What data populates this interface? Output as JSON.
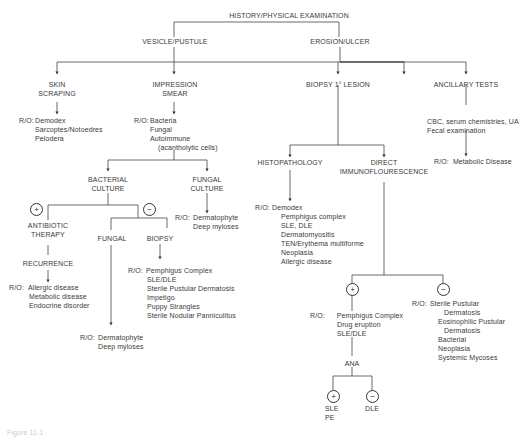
{
  "title": "HISTORY/PHYSICAL EXAMINATION",
  "branches": {
    "vesicle": "VESICLE/PUSTULE",
    "erosion": "EROSION/ULCER"
  },
  "nodes": {
    "skin_scraping": [
      "SKIN",
      "SCRAPING"
    ],
    "impression_smear": [
      "IMPRESSION",
      "SMEAR"
    ],
    "biopsy_lesion": "BIOPSY 1° LESION",
    "ancillary_tests": "ANCILLARY TESTS",
    "bacterial_culture": [
      "BACTERIAL",
      "CULTURE"
    ],
    "fungal_culture": [
      "FUNGAL",
      "CULTURE"
    ],
    "antibiotic_therapy": [
      "ANTIBIOTIC",
      "THERAPY"
    ],
    "recurrence": "RECURRENCE",
    "fungal": "FUNGAL",
    "biopsy": "BIOPSY",
    "histopathology": "HISTOPATHOLOGY",
    "direct_if": [
      "DIRECT",
      "IMMUNOFLOURESCENCE"
    ],
    "ana": "ANA",
    "ancillary_detail": [
      "CBC, serum chemistries, UA",
      "Fecal examination"
    ]
  },
  "ro_prefix": "R/O:",
  "rule_outs": {
    "skin_scraping": [
      "Demodex",
      "Sarcoptes/Notoedres",
      "Pelodera"
    ],
    "impression_smear": [
      "Bacteria",
      "Fungal",
      "Autoimmune",
      "(acantholytic cells)"
    ],
    "fungal_culture": [
      "Dermatophyte",
      "Deep myloses"
    ],
    "antibiotic": [
      "Allergic disease",
      "Metabolic disease",
      "Endocrine disorder"
    ],
    "fungal": [
      "Dermatophyte",
      "Deep myloses"
    ],
    "biopsy": [
      "Pemphigus Complex",
      "SLE/DLE",
      "Sterile Pustular Dermatosis",
      "Impetigo",
      "Puppy Strangles",
      "Sterile Nodular Panniculitus"
    ],
    "histopathology": [
      "Demodex",
      "Pemphigus complex",
      "SLE, DLE",
      "Dermatomyositis",
      "TEN/Erythema multiforme",
      "Neoplasia",
      "Allergic disease"
    ],
    "ancillary": [
      "Metabolic Disease"
    ],
    "dif_positive": [
      "Pemphigus Complex",
      "Drug eruption",
      "SLE/DLE"
    ],
    "dif_negative": [
      "Sterile Pustular",
      "Dermatosis",
      "Eosinophilic Pustular",
      "Dermatosis",
      "Bacterial",
      "Neoplasia",
      "Systemic Mycoses"
    ]
  },
  "ana_results": {
    "positive": [
      "SLE",
      "PE"
    ],
    "negative": [
      "DLE"
    ]
  },
  "signs": {
    "plus": "+",
    "minus": "−"
  },
  "caption": "Figure 11-1"
}
